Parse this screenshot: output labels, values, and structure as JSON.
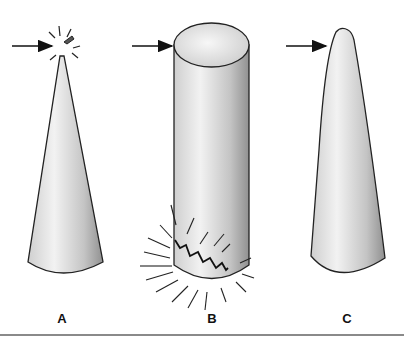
{
  "figure": {
    "panels": [
      {
        "id": "A",
        "label": "A",
        "shape": "cone (pointed tip)",
        "arrow_target": "tip",
        "effect": "tip fracture with impact rays"
      },
      {
        "id": "B",
        "label": "B",
        "shape": "cylinder",
        "arrow_target": "top edge",
        "effect": "base fracture with impact rays"
      },
      {
        "id": "C",
        "label": "C",
        "shape": "tapered cone (rounded tip)",
        "arrow_target": "upper side",
        "effect": "none"
      }
    ],
    "colors": {
      "outline": "#222222",
      "fill_light": "#eeeeee",
      "fill_dark": "#9a9a9a",
      "rule": "#8a8a8a"
    }
  }
}
